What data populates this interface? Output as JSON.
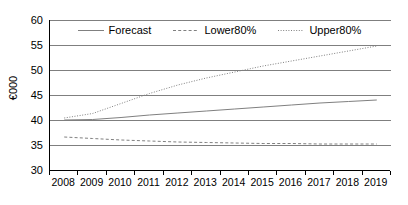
{
  "chart_data": {
    "type": "line",
    "title": "",
    "xlabel": "",
    "ylabel": "€000",
    "categories": [
      "2008",
      "2009",
      "2010",
      "2011",
      "2012",
      "2013",
      "2014",
      "2015",
      "2016",
      "2017",
      "2018",
      "2019"
    ],
    "ylim": [
      30,
      60
    ],
    "yticks": [
      30,
      35,
      40,
      45,
      50,
      55,
      60
    ],
    "ytick_labels": [
      "30",
      "35",
      "40",
      "45",
      "50",
      "55",
      "60"
    ],
    "grid": true,
    "grid_axis": "y",
    "legend_position": "top-center",
    "series": [
      {
        "name": "Forecast",
        "style": "solid",
        "color": "#808080",
        "values": [
          40.0,
          40.1,
          40.5,
          41.0,
          41.4,
          41.8,
          42.2,
          42.6,
          43.0,
          43.4,
          43.7,
          44.0
        ]
      },
      {
        "name": "Lower80%",
        "style": "dashed",
        "color": "#808080",
        "values": [
          36.6,
          36.3,
          36.0,
          35.8,
          35.6,
          35.5,
          35.4,
          35.3,
          35.3,
          35.2,
          35.2,
          35.2
        ]
      },
      {
        "name": "Upper80%",
        "style": "dotted",
        "color": "#808080",
        "values": [
          40.4,
          41.3,
          43.3,
          45.3,
          47.0,
          48.4,
          49.6,
          50.8,
          51.8,
          52.8,
          53.8,
          54.8
        ]
      }
    ]
  },
  "legend": {
    "items": [
      {
        "label": "Forecast",
        "style": "solid"
      },
      {
        "label": "Lower80%",
        "style": "dashed"
      },
      {
        "label": "Upper80%",
        "style": "dotted"
      }
    ]
  },
  "colors": {
    "axis": "#000000",
    "grid": "#7f7f7f",
    "series": "#808080",
    "background": "#ffffff"
  }
}
